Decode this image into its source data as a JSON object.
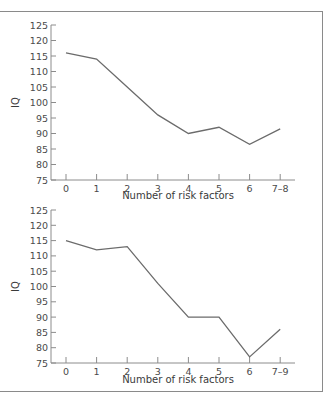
{
  "chart_data": [
    {
      "type": "line",
      "title": "",
      "xlabel": "Number of risk factors",
      "ylabel": "IQ",
      "categories": [
        "0",
        "1",
        "2",
        "3",
        "4",
        "5",
        "6",
        "7–8"
      ],
      "values": [
        116,
        114,
        105,
        96,
        90,
        92,
        86.5,
        91.5
      ],
      "ylim": [
        75,
        125
      ],
      "yticks": [
        75,
        80,
        85,
        90,
        95,
        100,
        105,
        110,
        115,
        120,
        125
      ],
      "grid": false,
      "line_color": "#6b6b6b"
    },
    {
      "type": "line",
      "title": "",
      "xlabel": "Number of risk factors",
      "ylabel": "IQ",
      "categories": [
        "0",
        "1",
        "2",
        "3",
        "4",
        "5",
        "6",
        "7–9"
      ],
      "values": [
        115,
        112,
        113,
        101,
        90,
        90,
        77,
        86
      ],
      "ylim": [
        75,
        125
      ],
      "yticks": [
        75,
        80,
        85,
        90,
        95,
        100,
        105,
        110,
        115,
        120,
        125
      ],
      "grid": false,
      "line_color": "#6b6b6b"
    }
  ],
  "charts": [
    {
      "ylabel": "IQ",
      "xlabel": "Number of risk factors"
    },
    {
      "ylabel": "IQ",
      "xlabel": "Number of risk factors"
    }
  ]
}
